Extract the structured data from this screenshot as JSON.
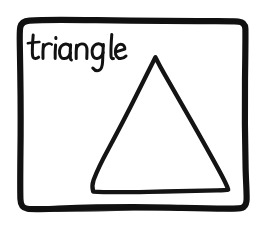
{
  "sketch": {
    "kind": "hand-drawn-diagram",
    "background_color": "#ffffff",
    "ink_color": "#111111",
    "canvas": {
      "width": 271,
      "height": 225
    },
    "frame": {
      "name": "hand-drawn-rounded-rectangle-border",
      "stroke_width": 6,
      "top_left": "20,21",
      "top_right": "245,22",
      "bottom_right": "247,207",
      "bottom_left": "21,209"
    },
    "label": {
      "text": "triangle",
      "style": "handwritten-lowercase",
      "x": 28,
      "baseline_y": 58
    },
    "shape": {
      "name": "triangle",
      "sides": 3,
      "stroke_width": 4,
      "apex": "155,57",
      "base_left": "93,192",
      "base_right": "228,190",
      "filled": "no"
    }
  }
}
